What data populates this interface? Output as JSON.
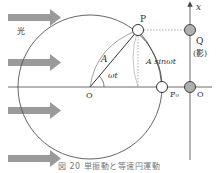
{
  "diagram": {
    "labels": {
      "light": "光",
      "P": "P",
      "Q": "Q",
      "shadow": "(影)",
      "x_axis": "x",
      "amplitude": "A",
      "angle": "ωt",
      "projection": "A sinωt",
      "center_O": "O",
      "axis_origin_O": "O",
      "P0": "P₀"
    },
    "caption": "図 20 単振動と等速円運動",
    "colors": {
      "arrow": "#9a9a9a",
      "line": "#444444",
      "shadow_point": "#b0b0b0",
      "point_fill": "#ffffff"
    },
    "elements": {
      "light_arrows": 4,
      "circle": {
        "cx": 90,
        "cy": 87,
        "r": 72
      },
      "points": [
        "P",
        "P0",
        "Q",
        "O"
      ]
    }
  }
}
